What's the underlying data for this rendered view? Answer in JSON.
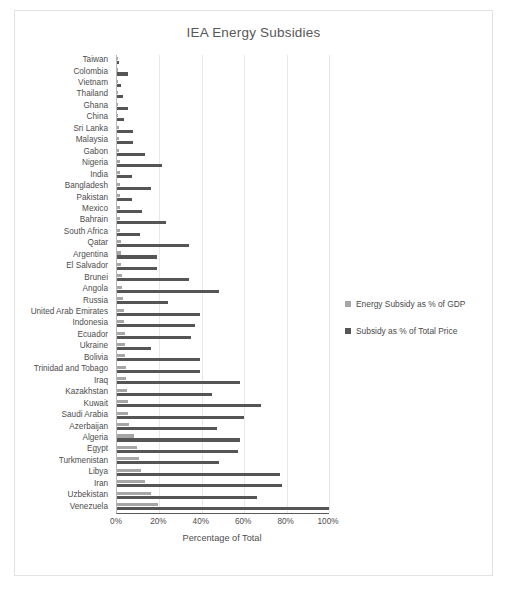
{
  "chart_data": {
    "type": "bar",
    "orientation": "horizontal",
    "title": "IEA Energy Subsidies",
    "xlabel": "Percentage of Total",
    "ylabel": "",
    "xlim": [
      0,
      100
    ],
    "xticks": [
      "0%",
      "20%",
      "40%",
      "60%",
      "80%",
      "100%"
    ],
    "xtick_values": [
      0,
      20,
      40,
      60,
      80,
      100
    ],
    "grid": true,
    "legend_position": "right",
    "colors": {
      "gdp": "#a6a6a6",
      "price": "#555555",
      "axis": "#5a5a5a",
      "gridline": "#e8e8e8",
      "text": "#4d4d4d"
    },
    "categories": [
      "Taiwan",
      "Colombia",
      "Vietnam",
      "Thailand",
      "Ghana",
      "China",
      "Sri Lanka",
      "Malaysia",
      "Gabon",
      "Nigeria",
      "India",
      "Bangladesh",
      "Pakistan",
      "Mexico",
      "Bahrain",
      "South Africa",
      "Qatar",
      "Argentina",
      "El Salvador",
      "Brunei",
      "Angola",
      "Russia",
      "United Arab Emirates",
      "Indonesia",
      "Ecuador",
      "Ukraine",
      "Bolivia",
      "Trinidad and Tobago",
      "Iraq",
      "Kazakhstan",
      "Kuwait",
      "Saudi Arabia",
      "Azerbaijan",
      "Algeria",
      "Egypt",
      "Turkmenistan",
      "Libya",
      "Iran",
      "Uzbekistan",
      "Venezuela"
    ],
    "series": [
      {
        "name": "Energy Subsidy as % of GDP",
        "key": "gdp",
        "color": "#a6a6a6",
        "values": [
          0.2,
          0.3,
          0.4,
          0.5,
          0.5,
          0.6,
          0.8,
          0.9,
          1.0,
          1.2,
          1.3,
          1.4,
          1.5,
          1.5,
          1.6,
          1.6,
          1.8,
          1.9,
          2.0,
          2.2,
          2.5,
          2.6,
          3.4,
          3.5,
          3.6,
          3.9,
          4.0,
          4.2,
          4.4,
          4.6,
          5.0,
          5.2,
          5.5,
          8.0,
          9.5,
          10.5,
          11.5,
          13.0,
          16.0,
          19.5
        ]
      },
      {
        "name": "Subsidy as % of Total Price",
        "key": "price",
        "color": "#555555",
        "values": [
          1.0,
          5.0,
          2.0,
          3.0,
          5.0,
          3.5,
          7.5,
          7.5,
          13.0,
          21.0,
          7.0,
          16.0,
          7.0,
          12.0,
          23.0,
          11.0,
          34.0,
          19.0,
          19.0,
          34.0,
          48.0,
          24.0,
          39.0,
          37.0,
          35.0,
          16.0,
          39.0,
          39.0,
          58.0,
          45.0,
          68.0,
          60.0,
          47.0,
          58.0,
          57.0,
          48.0,
          77.0,
          78.0,
          66.0,
          100.0
        ]
      }
    ]
  },
  "legend": {
    "items": [
      {
        "label": "Energy Subsidy as % of GDP",
        "swatch": "sw-gdp"
      },
      {
        "label": "Subsidy as % of Total Price",
        "swatch": "sw-price"
      }
    ]
  }
}
